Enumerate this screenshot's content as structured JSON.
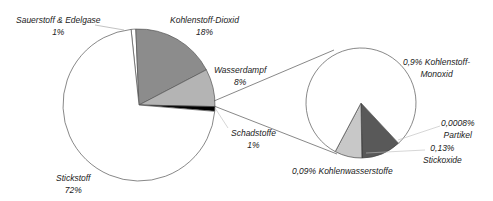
{
  "chart_data": {
    "type": "pie",
    "subtype": "pie-of-pie",
    "title": "",
    "main_pie": {
      "slices": [
        {
          "label": "Stickstoff",
          "value": 72,
          "value_label": "72%",
          "color": "#ffffff"
        },
        {
          "label": "Sauerstoff & Edelgase",
          "value": 1,
          "value_label": "1%",
          "color": "#ffffff"
        },
        {
          "label": "Kohlenstoff-Dioxid",
          "value": 18,
          "value_label": "18%",
          "color": "#8c8c8c"
        },
        {
          "label": "Wasserdampf",
          "value": 8,
          "value_label": "8%",
          "color": "#b4b4b4"
        },
        {
          "label": "Schadstoffe",
          "value": 1,
          "value_label": "1%",
          "color": "#000000"
        }
      ]
    },
    "secondary_pie": {
      "parent": "Schadstoffe",
      "slices": [
        {
          "label": "Kohlenstoff-Monoxid",
          "value": 0.9,
          "value_label": "0,9% Kohlenstoff-Monoxid",
          "color": "#ffffff"
        },
        {
          "label": "Kohlenwasserstoffe",
          "value": 0.09,
          "value_label": "0,09% Kohlenwasserstoffe",
          "color": "#c8c8c8"
        },
        {
          "label": "Stickoxide",
          "value": 0.13,
          "value_label": "0,13% Stickoxide",
          "color": "#595959"
        },
        {
          "label": "Partikel",
          "value": 0.0008,
          "value_label": "0,0008% Partikel",
          "color": "#000000"
        }
      ]
    },
    "legend": "none",
    "grid": false
  },
  "labels": {
    "sauerstoff": {
      "name": "Sauerstoff & Edelgase",
      "pct": "1%"
    },
    "co2": {
      "name": "Kohlenstoff-Dioxid",
      "pct": "18%"
    },
    "wasserdampf": {
      "name": "Wasserdampf",
      "pct": "8%"
    },
    "schadstoffe": {
      "name": "Schadstoffe",
      "pct": "1%"
    },
    "stickstoff": {
      "name": "Stickstoff",
      "pct": "72%"
    },
    "co": {
      "line1": "0,9% Kohlenstoff-",
      "line2": "Monoxid"
    },
    "partikel": {
      "line1": "0,0008%",
      "line2": "Partikel"
    },
    "stickoxide": {
      "line1": "0,13%",
      "line2": "Stickoxide"
    },
    "hc": {
      "line1": "0,09% Kohlenwasserstoffe"
    }
  }
}
